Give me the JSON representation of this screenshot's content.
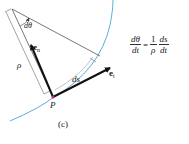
{
  "figure": {
    "caption": "(c)",
    "colors": {
      "curve": "#5aaedc",
      "radius_lines": "#555555",
      "arrows": "#111111",
      "point": "#c0306a",
      "ds_arc": "#999999"
    },
    "labels": {
      "dtheta": "dθ",
      "rho": "ρ",
      "ds": "ds",
      "point": "P",
      "e_n_main": "e",
      "e_n_sub": "n",
      "e_t_main": "e",
      "e_t_sub": "t"
    },
    "equation": {
      "lhs_num": "dθ",
      "lhs_den": "dt",
      "equals": "=",
      "coef_num": "1",
      "coef_den": "ρ",
      "rhs_num": "ds",
      "rhs_den": "dt"
    }
  }
}
